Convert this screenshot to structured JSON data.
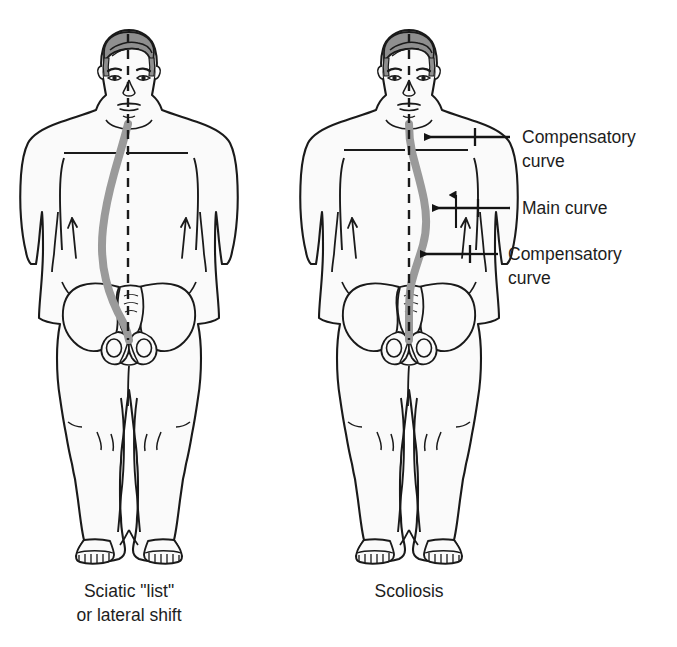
{
  "figure": {
    "type": "medical-illustration",
    "background_color": "#ffffff",
    "outline_color": "#1a1a1a",
    "body_fill_color": "#fafafa",
    "spine_color": "#9a9a9a",
    "plumbline_color": "#1a1a1a"
  },
  "panels": [
    {
      "id": "left-panel",
      "name": "sciatic-list-figure",
      "caption_line1": "Sciatic \"list\"",
      "caption_line2": "or lateral shift",
      "spine_description": "single long C-curve deviating to the patient's right of the plumb line",
      "plumbline": "vertical dashed line from vertex of head to gluteal cleft"
    },
    {
      "id": "right-panel",
      "name": "scoliosis-figure",
      "caption_line1": "Scoliosis",
      "caption_line2": "",
      "spine_description": "S-shaped curve with main thoracic curve and compensatory curves above and below",
      "plumbline": "vertical dashed line from vertex of head to gluteal cleft"
    }
  ],
  "annotations": [
    {
      "id": "annot-upper",
      "name": "compensatory-curve-upper",
      "line1": "Compensatory",
      "line2": "curve",
      "arrow": "left-pointing",
      "target": "upper thoracic spine"
    },
    {
      "id": "annot-main",
      "name": "main-curve",
      "line1": "Main curve",
      "line2": "",
      "arrow": "left-pointing",
      "target": "mid thoracolumbar spine"
    },
    {
      "id": "annot-lower",
      "name": "compensatory-curve-lower",
      "line1": "Compensatory",
      "line2": "curve",
      "arrow": "left-pointing",
      "target": "lumbosacral spine"
    }
  ],
  "icon_names": [
    "human-figure-posterior-icon",
    "spine-curve-icon",
    "plumb-line-icon",
    "pelvis-icon",
    "arrow-left-icon"
  ]
}
